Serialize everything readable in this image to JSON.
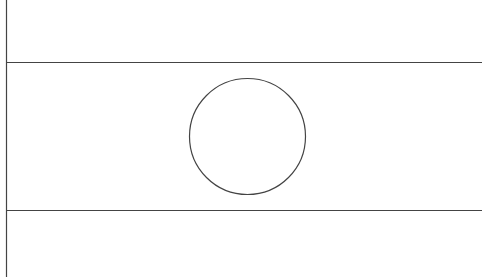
{
  "figure": {
    "stroke_color": "#444444",
    "background_color": "#ffffff",
    "bands": 3,
    "has_circle": true
  }
}
